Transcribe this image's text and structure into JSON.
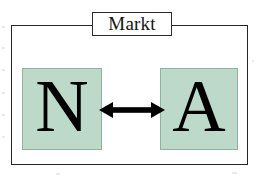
{
  "diagram": {
    "frame": {
      "label": "Markt",
      "border_color": "#26262a",
      "background": "#ffffff"
    },
    "nodes": [
      {
        "id": "n",
        "letter": "N",
        "meaning": "Nachfrage",
        "fill_color": "#bdd9c9",
        "border_color": "#8fb3a1",
        "text_color": "#000000"
      },
      {
        "id": "a",
        "letter": "A",
        "meaning": "Angebot",
        "fill_color": "#bdd9c9",
        "border_color": "#8fb3a1",
        "text_color": "#000000"
      }
    ],
    "connector": {
      "type": "double-headed-arrow",
      "orientation": "horizontal",
      "color": "#000000",
      "from": "n",
      "to": "a"
    }
  }
}
